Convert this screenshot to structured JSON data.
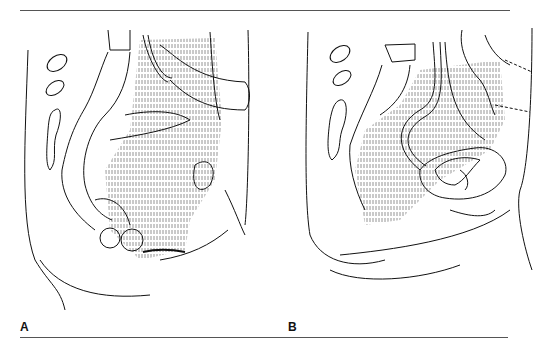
{
  "figure": {
    "panels": [
      {
        "label": "A",
        "description": "Sagittal view of pelvis with colon loop draped across pelvic wall; bowel segments rounded at bottom"
      },
      {
        "label": "B",
        "description": "Sagittal view of pelvis with ureter/vessel looping down to a pelvic organ mass"
      }
    ],
    "colors": {
      "ink": "#111111",
      "rule": "#555555",
      "background": "#ffffff",
      "hatching": "#777777"
    }
  }
}
